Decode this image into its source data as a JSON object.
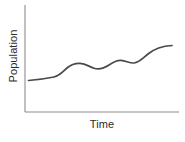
{
  "figure": {
    "name": "population-over-time-line-chart",
    "background_color": "#ffffff"
  },
  "axes": {
    "x_label": "Time",
    "y_label": "Population",
    "axis_color": "#8c8c8c",
    "label_color": "#2b2b2b",
    "x_ticks": [],
    "y_ticks": [],
    "grid": false
  },
  "series_style": {
    "line_color": "#4a4a4a",
    "line_width": 1.7
  },
  "chart_data": {
    "type": "line",
    "title": "",
    "xlabel": "Time",
    "ylabel": "Population",
    "xlim": [
      0,
      100
    ],
    "ylim": [
      0,
      100
    ],
    "grid": false,
    "legend": "none",
    "x_tick_labels": [],
    "y_tick_labels": [],
    "series": [
      {
        "name": "Population",
        "color": "#4a4a4a",
        "x": [
          0,
          5,
          11,
          17,
          22,
          28,
          33,
          38,
          44,
          50,
          56,
          61,
          66,
          72,
          78,
          84,
          90,
          95,
          100
        ],
        "y": [
          30,
          31,
          32,
          33,
          34,
          40,
          45,
          46,
          45,
          44,
          47,
          50,
          50,
          49,
          50,
          56,
          64,
          70,
          74
        ]
      }
    ],
    "annotations": []
  },
  "geometry": {
    "plot_left": 25,
    "plot_right": 179,
    "plot_top": 5,
    "plot_bottom": 112,
    "curve_path": "M 28.5,80.5 C 38,79.8 46,78.6 54,77.0 C 60,75.8 63,71.5 67,68.0 C 71,64.6 75,63.2 80,63.4 C 86,63.7 89,66.7 94,68.2 C 99,69.7 104,68.3 109,65.0 C 113,62.3 117,60.2 121,60.4 C 126,60.7 129,63.2 134,63.0 C 139,62.8 143,58.2 148,54.0 C 154,49.0 162,46.0 172,45.5"
  }
}
